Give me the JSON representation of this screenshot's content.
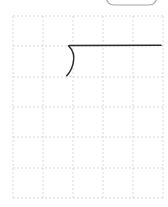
{
  "window": {
    "width": 168,
    "height": 207,
    "background": "#ffffff"
  },
  "clipped_button": {
    "left": 106.5,
    "width": 50,
    "bottom_edge_y": 5,
    "visible_height": 16,
    "corner_radius": 7,
    "border_color": "#a6a6a6",
    "border_width": 1.2,
    "fill": "#ffffff"
  },
  "grid": {
    "line_color": "#d7d7d7",
    "dash_pattern": "2 2",
    "line_width": 1,
    "left": 13,
    "right": 163,
    "top": 16,
    "bottom": 198,
    "vertical_x": [
      13,
      43,
      73,
      103,
      133,
      163
    ],
    "horizontal_y": [
      16,
      46,
      77,
      107,
      137,
      168,
      198
    ]
  },
  "ink": {
    "color": "#2b2b2b",
    "stroke_width": 1.5,
    "strokes": [
      {
        "name": "curve-stroke",
        "path": "M 68.5 45.8 C 72.8 50.2 74.5 55.2 73.6 60.5 C 72.9 66.5 70.6 71.6 66.8 75.8"
      },
      {
        "name": "horizontal-stroke",
        "path": "M 69.5 45.4 L 161 45.3"
      }
    ]
  }
}
